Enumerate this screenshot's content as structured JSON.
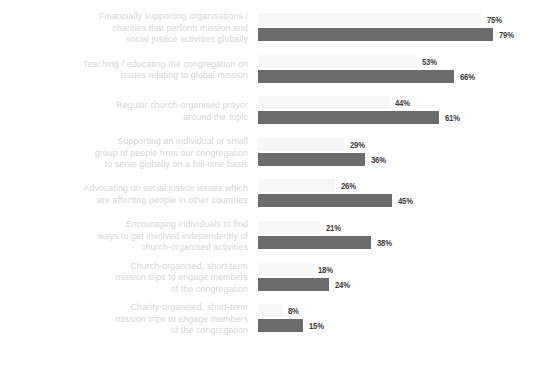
{
  "chart_data": {
    "type": "bar",
    "orientation": "horizontal",
    "title": "",
    "subtitle": "",
    "xlabel": "",
    "ylabel": "",
    "grid": false,
    "legend": false,
    "legend_position": "none",
    "xlim": [
      0,
      100
    ],
    "value_suffix": "%",
    "colors": {
      "series_light": "#f7f7f7",
      "series_dark": "#6b6b6b",
      "label_text": "#d6d6d6",
      "value_text": "#3b3b3b",
      "background": "#ffffff"
    },
    "categories": [
      "Financially supporting organisations /\ncharities that perform mission and\nsocial justice activities globally",
      "Teaching / educating the congregation on\nissues relating to global mission",
      "Regular church-organised prayer\naround the topic",
      "Supporting an individual or small\ngroup of people from our congregation\nto serve globally on a full-time basis",
      "Advocating on social justice issues which\nare affecting people in other countries",
      "Encouraging individuals to find\nways to get involved independently of\nchurch-organised activities",
      "Church-organised, short-term\nmission trips to engage members\nof the congregation",
      "Charity-organised, short-term\nmission trips to engage members\nof the congregation"
    ],
    "series": [
      {
        "name": "series-light",
        "color": "#f7f7f7",
        "values": [
          75,
          53,
          44,
          29,
          26,
          21,
          18,
          8
        ],
        "labels": [
          "75%",
          "53%",
          "44%",
          "29%",
          "26%",
          "21%",
          "18%",
          "8%"
        ]
      },
      {
        "name": "series-dark",
        "color": "#6b6b6b",
        "values": [
          79,
          66,
          61,
          36,
          45,
          38,
          24,
          15
        ],
        "labels": [
          "79%",
          "66%",
          "61%",
          "36%",
          "45%",
          "38%",
          "24%",
          "15%"
        ]
      }
    ]
  }
}
